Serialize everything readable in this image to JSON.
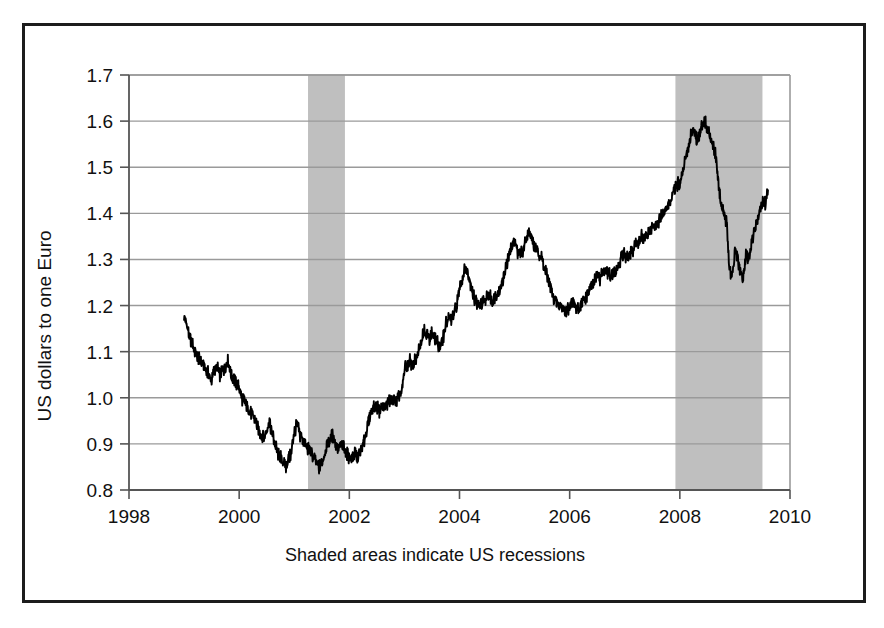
{
  "figure": {
    "frame_color": "#1c1c1c",
    "background": "#ffffff"
  },
  "caption": {
    "text": "Shaded areas indicate US recessions"
  },
  "chart_data": {
    "type": "line",
    "title": "",
    "subtitle": "",
    "xlabel": "",
    "ylabel": "US dollars to one Euro",
    "annotation": "Shaded areas indicate US recessions",
    "grid": true,
    "legend": "none",
    "line_color": "#000000",
    "shade_color": "#bfbfbf",
    "grid_color": "#9a9a9a",
    "axis_color": "#555555",
    "xlim": [
      1998,
      2010
    ],
    "ylim": [
      0.8,
      1.7
    ],
    "xticks": [
      1998,
      2000,
      2002,
      2004,
      2006,
      2008,
      2010
    ],
    "xticklabels": [
      "1998",
      "2000",
      "2002",
      "2004",
      "2006",
      "2008",
      "2010"
    ],
    "yticks": [
      0.8,
      0.9,
      1.0,
      1.1,
      1.2,
      1.3,
      1.4,
      1.5,
      1.6,
      1.7
    ],
    "yticklabels": [
      "0.8",
      "0.9",
      "1.0",
      "1.1",
      "1.2",
      "1.3",
      "1.4",
      "1.5",
      "1.6",
      "1.7"
    ],
    "shaded_regions": [
      {
        "label": "US recession 2001",
        "x0": 2001.25,
        "x1": 2001.92
      },
      {
        "label": "US recession 2007-2009",
        "x0": 2007.92,
        "x1": 2009.5
      }
    ],
    "series": [
      {
        "name": "USD per EUR",
        "x": [
          1999.0,
          1999.05,
          1999.1,
          1999.15,
          1999.2,
          1999.25,
          1999.3,
          1999.35,
          1999.4,
          1999.45,
          1999.5,
          1999.55,
          1999.6,
          1999.65,
          1999.7,
          1999.75,
          1999.8,
          1999.85,
          1999.9,
          1999.95,
          2000.0,
          2000.05,
          2000.1,
          2000.15,
          2000.2,
          2000.25,
          2000.3,
          2000.35,
          2000.4,
          2000.45,
          2000.5,
          2000.55,
          2000.6,
          2000.65,
          2000.7,
          2000.75,
          2000.8,
          2000.85,
          2000.9,
          2000.95,
          2001.0,
          2001.05,
          2001.1,
          2001.15,
          2001.2,
          2001.25,
          2001.3,
          2001.35,
          2001.4,
          2001.45,
          2001.5,
          2001.55,
          2001.6,
          2001.65,
          2001.7,
          2001.75,
          2001.8,
          2001.85,
          2001.9,
          2001.95,
          2002.0,
          2002.05,
          2002.1,
          2002.15,
          2002.2,
          2002.25,
          2002.3,
          2002.35,
          2002.4,
          2002.45,
          2002.5,
          2002.55,
          2002.6,
          2002.65,
          2002.7,
          2002.75,
          2002.8,
          2002.85,
          2002.9,
          2002.95,
          2003.0,
          2003.05,
          2003.1,
          2003.15,
          2003.2,
          2003.25,
          2003.3,
          2003.35,
          2003.4,
          2003.45,
          2003.5,
          2003.55,
          2003.6,
          2003.65,
          2003.7,
          2003.75,
          2003.8,
          2003.85,
          2003.9,
          2003.95,
          2004.0,
          2004.05,
          2004.1,
          2004.15,
          2004.2,
          2004.25,
          2004.3,
          2004.35,
          2004.4,
          2004.45,
          2004.5,
          2004.55,
          2004.6,
          2004.65,
          2004.7,
          2004.75,
          2004.8,
          2004.85,
          2004.9,
          2004.95,
          2005.0,
          2005.05,
          2005.1,
          2005.15,
          2005.2,
          2005.25,
          2005.3,
          2005.35,
          2005.4,
          2005.45,
          2005.5,
          2005.55,
          2005.6,
          2005.65,
          2005.7,
          2005.75,
          2005.8,
          2005.85,
          2005.9,
          2005.95,
          2006.0,
          2006.05,
          2006.1,
          2006.15,
          2006.2,
          2006.25,
          2006.3,
          2006.35,
          2006.4,
          2006.45,
          2006.5,
          2006.55,
          2006.6,
          2006.65,
          2006.7,
          2006.75,
          2006.8,
          2006.85,
          2006.9,
          2006.95,
          2007.0,
          2007.05,
          2007.1,
          2007.15,
          2007.2,
          2007.25,
          2007.3,
          2007.35,
          2007.4,
          2007.45,
          2007.5,
          2007.55,
          2007.6,
          2007.65,
          2007.7,
          2007.75,
          2007.8,
          2007.85,
          2007.9,
          2007.95,
          2008.0,
          2008.05,
          2008.1,
          2008.15,
          2008.2,
          2008.25,
          2008.3,
          2008.35,
          2008.4,
          2008.45,
          2008.5,
          2008.55,
          2008.6,
          2008.65,
          2008.7,
          2008.75,
          2008.8,
          2008.85,
          2008.9,
          2008.95,
          2009.0,
          2009.05,
          2009.1,
          2009.15,
          2009.2,
          2009.25,
          2009.3,
          2009.35,
          2009.4,
          2009.45,
          2009.5,
          2009.55,
          2009.6
        ],
        "values": [
          1.18,
          1.16,
          1.13,
          1.12,
          1.1,
          1.09,
          1.08,
          1.07,
          1.06,
          1.05,
          1.04,
          1.06,
          1.07,
          1.05,
          1.06,
          1.07,
          1.08,
          1.05,
          1.04,
          1.03,
          1.02,
          1.0,
          0.99,
          0.98,
          0.97,
          0.96,
          0.95,
          0.93,
          0.92,
          0.91,
          0.93,
          0.95,
          0.92,
          0.9,
          0.88,
          0.87,
          0.86,
          0.85,
          0.87,
          0.88,
          0.93,
          0.94,
          0.92,
          0.91,
          0.9,
          0.89,
          0.88,
          0.87,
          0.86,
          0.85,
          0.86,
          0.88,
          0.9,
          0.91,
          0.92,
          0.9,
          0.89,
          0.9,
          0.89,
          0.88,
          0.87,
          0.87,
          0.88,
          0.87,
          0.88,
          0.9,
          0.92,
          0.95,
          0.97,
          0.98,
          0.98,
          0.97,
          0.98,
          0.98,
          0.99,
          0.99,
          1.0,
          0.99,
          1.0,
          1.01,
          1.06,
          1.07,
          1.08,
          1.07,
          1.08,
          1.1,
          1.12,
          1.15,
          1.14,
          1.13,
          1.14,
          1.13,
          1.12,
          1.11,
          1.13,
          1.16,
          1.17,
          1.17,
          1.18,
          1.2,
          1.24,
          1.26,
          1.28,
          1.27,
          1.25,
          1.22,
          1.21,
          1.2,
          1.2,
          1.21,
          1.22,
          1.22,
          1.21,
          1.22,
          1.23,
          1.24,
          1.26,
          1.29,
          1.31,
          1.33,
          1.34,
          1.32,
          1.31,
          1.32,
          1.34,
          1.36,
          1.35,
          1.33,
          1.32,
          1.31,
          1.3,
          1.28,
          1.26,
          1.24,
          1.22,
          1.21,
          1.2,
          1.2,
          1.19,
          1.19,
          1.2,
          1.21,
          1.2,
          1.19,
          1.2,
          1.21,
          1.22,
          1.23,
          1.24,
          1.25,
          1.27,
          1.26,
          1.27,
          1.28,
          1.27,
          1.26,
          1.27,
          1.28,
          1.29,
          1.31,
          1.31,
          1.3,
          1.31,
          1.32,
          1.33,
          1.34,
          1.35,
          1.34,
          1.35,
          1.36,
          1.37,
          1.37,
          1.38,
          1.39,
          1.4,
          1.41,
          1.42,
          1.43,
          1.45,
          1.46,
          1.47,
          1.49,
          1.52,
          1.54,
          1.57,
          1.58,
          1.56,
          1.57,
          1.59,
          1.6,
          1.58,
          1.57,
          1.55,
          1.53,
          1.47,
          1.42,
          1.4,
          1.38,
          1.28,
          1.26,
          1.32,
          1.3,
          1.27,
          1.26,
          1.31,
          1.3,
          1.33,
          1.36,
          1.38,
          1.41,
          1.43,
          1.42,
          1.45
        ]
      }
    ]
  }
}
